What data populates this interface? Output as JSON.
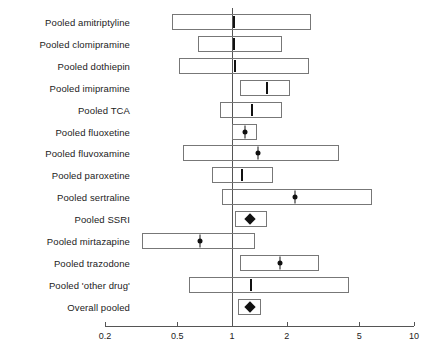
{
  "chart_data": {
    "type": "bar",
    "subtype": "forest-plot",
    "title": "",
    "xlabel": "",
    "ylabel": "",
    "xscale": "log",
    "xlim": [
      0.2,
      10
    ],
    "grid": false,
    "legend": null,
    "reference_line": 1,
    "tick_labels": [
      "0.2",
      "0.5",
      "1",
      "2",
      "5",
      "10"
    ],
    "tick_values": [
      0.2,
      0.5,
      1,
      2,
      5,
      10
    ],
    "categories": [
      "Pooled amitriptyline",
      "Pooled clomipramine",
      "Pooled dothiepin",
      "Pooled imipramine",
      "Pooled TCA",
      "Pooled fluoxetine",
      "Pooled fluvoxamine",
      "Pooled paroxetine",
      "Pooled sertraline",
      "Pooled SSRI",
      "Pooled mirtazapine",
      "Pooled trazodone",
      "Pooled 'other drug'",
      "Overall pooled"
    ],
    "rows": [
      {
        "label": "Pooled amitriptyline",
        "estimate": 1.02,
        "ci_low": 0.47,
        "ci_high": 2.72,
        "marker": "tick"
      },
      {
        "label": "Pooled clomipramine",
        "estimate": 1.02,
        "ci_low": 0.65,
        "ci_high": 1.89,
        "marker": "tick"
      },
      {
        "label": "Pooled dothiepin",
        "estimate": 1.04,
        "ci_low": 0.51,
        "ci_high": 2.65,
        "marker": "tick"
      },
      {
        "label": "Pooled imipramine",
        "estimate": 1.55,
        "ci_low": 1.1,
        "ci_high": 2.08,
        "marker": "tick"
      },
      {
        "label": "Pooled TCA",
        "estimate": 1.29,
        "ci_low": 0.86,
        "ci_high": 1.89,
        "marker": "tick"
      },
      {
        "label": "Pooled fluoxetine",
        "estimate": 1.18,
        "ci_low": 1.0,
        "ci_high": 1.37,
        "marker": "dot"
      },
      {
        "label": "Pooled fluvoxamine",
        "estimate": 1.39,
        "ci_low": 0.54,
        "ci_high": 3.88,
        "marker": "dot"
      },
      {
        "label": "Pooled paroxetine",
        "estimate": 1.14,
        "ci_low": 0.78,
        "ci_high": 1.68,
        "marker": "tick"
      },
      {
        "label": "Pooled sertraline",
        "estimate": 2.23,
        "ci_low": 0.88,
        "ci_high": 5.85,
        "marker": "dot"
      },
      {
        "label": "Pooled SSRI",
        "estimate": 1.25,
        "ci_low": 1.04,
        "ci_high": 1.55,
        "marker": "diamond"
      },
      {
        "label": "Pooled mirtazapine",
        "estimate": 0.67,
        "ci_low": 0.32,
        "ci_high": 1.33,
        "marker": "dot"
      },
      {
        "label": "Pooled trazodone",
        "estimate": 1.83,
        "ci_low": 1.11,
        "ci_high": 2.99,
        "marker": "dot"
      },
      {
        "label": "Pooled 'other drug'",
        "estimate": 1.27,
        "ci_low": 0.58,
        "ci_high": 4.38,
        "marker": "tick"
      },
      {
        "label": "Overall pooled",
        "estimate": 1.25,
        "ci_low": 1.08,
        "ci_high": 1.45,
        "marker": "diamond"
      }
    ]
  },
  "colors": {
    "box_stroke": "#777777",
    "marker": "#111111",
    "axis": "#555555",
    "reference_line": "#555555",
    "text": "#222222",
    "background": "#ffffff"
  }
}
